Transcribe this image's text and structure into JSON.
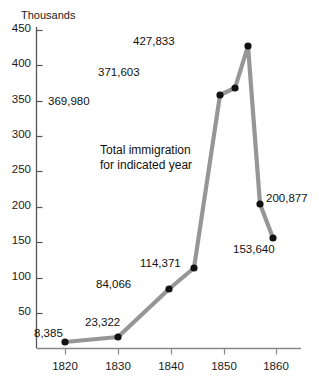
{
  "chart_data": {
    "type": "line",
    "title": "",
    "annotation": [
      "Total immigration",
      "for indicated year"
    ],
    "ylabel": "Thousands",
    "xlabel": "",
    "ylim": [
      0,
      450
    ],
    "xlim": [
      1818,
      1864
    ],
    "grid": false,
    "legend": "none",
    "y_ticks": [
      450,
      400,
      350,
      300,
      250,
      200,
      150,
      100,
      50
    ],
    "x_ticks": [
      1820,
      1830,
      1840,
      1850,
      1860
    ],
    "series": [
      {
        "name": "Total immigration",
        "color": "#969696",
        "marker_color": "#111111",
        "points": [
          {
            "x": 1820,
            "y": 8385,
            "label": "8,385",
            "label_pos": "left-above"
          },
          {
            "x": 1830,
            "y": 23322,
            "label": "23,322",
            "label_pos": "left-above"
          },
          {
            "x": 1837,
            "y": 84066,
            "label": "84,066",
            "label_pos": "left-above"
          },
          {
            "x": 1842,
            "y": 114371,
            "label": "114,371",
            "label_pos": "left-above"
          },
          {
            "x": 1847,
            "y": 369980,
            "label": "369,980",
            "label_pos": "left-below"
          },
          {
            "x": 1850,
            "y": 371603,
            "label": "371,603",
            "label_pos": "left-above"
          },
          {
            "x": 1854,
            "y": 427833,
            "label": "427,833",
            "label_pos": "left"
          },
          {
            "x": 1858,
            "y": 200877,
            "label": "200,877",
            "label_pos": "right"
          },
          {
            "x": 1860,
            "y": 153640,
            "label": "153,640",
            "label_pos": "left-below"
          }
        ]
      }
    ]
  },
  "geometry": {
    "y_tick_px": [
      30,
      65,
      101,
      136,
      171,
      207,
      242,
      278,
      313
    ],
    "x_tick_px": [
      65,
      118,
      171,
      224,
      276
    ],
    "points_px": [
      {
        "cx": 65,
        "cy": 342
      },
      {
        "cx": 118,
        "cy": 337
      },
      {
        "cx": 169,
        "cy": 289
      },
      {
        "cx": 194,
        "cy": 268
      },
      {
        "cx": 220,
        "cy": 95
      },
      {
        "cx": 235,
        "cy": 88
      },
      {
        "cx": 248,
        "cy": 46
      },
      {
        "cx": 260,
        "cy": 204
      },
      {
        "cx": 273,
        "cy": 238
      }
    ],
    "label_px": [
      {
        "x": 34,
        "y": 327,
        "align": "left"
      },
      {
        "x": 85,
        "y": 316,
        "align": "left"
      },
      {
        "x": 96,
        "y": 278,
        "align": "left"
      },
      {
        "x": 140,
        "y": 257,
        "align": "left"
      },
      {
        "x": 48,
        "y": 95,
        "align": "left"
      },
      {
        "x": 98,
        "y": 66,
        "align": "left"
      },
      {
        "x": 133,
        "y": 35,
        "align": "left"
      },
      {
        "x": 266,
        "y": 192,
        "align": "left"
      },
      {
        "x": 233,
        "y": 243,
        "align": "left"
      }
    ]
  }
}
